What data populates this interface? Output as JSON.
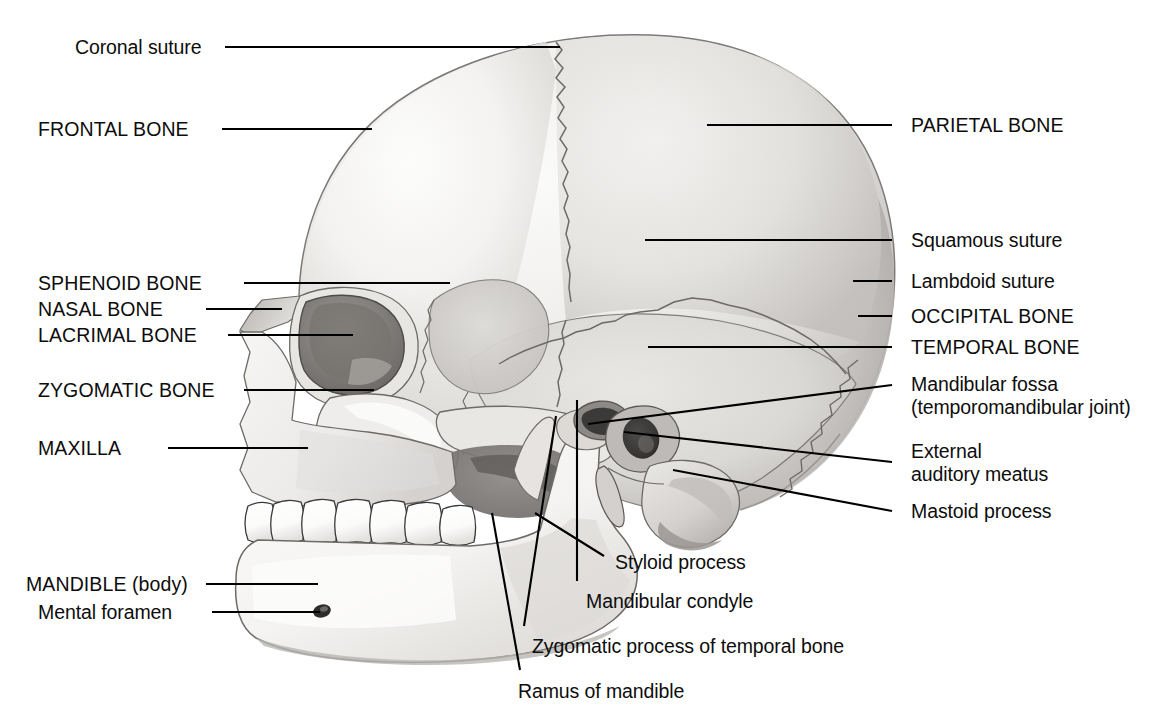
{
  "figure": {
    "type": "anatomical-illustration",
    "view": "lateral (left side)",
    "style": "grayscale pencil/airbrush rendering on white background",
    "colors": {
      "background": "#ffffff",
      "label_text": "#0d0d0d",
      "leader_line": "#000000",
      "bone_light": "#f2f1ef",
      "bone_mid": "#d9d7d4",
      "bone_shadow": "#b3b0ad",
      "bone_dark": "#8d8a87",
      "suture_line": "#6d6a67",
      "tooth_fill": "#fdfdfc",
      "tooth_outline": "#3a3a3a",
      "orbit_dark": "#7b7875"
    }
  },
  "labels": {
    "left": [
      {
        "id": "coronal-suture",
        "text": "Coronal suture",
        "caps": false,
        "x": 75,
        "y": 36,
        "line": {
          "x1": 225,
          "y1": 47,
          "x2": 560,
          "y2": 47
        }
      },
      {
        "id": "frontal-bone",
        "text": "FRONTAL BONE",
        "caps": true,
        "x": 38,
        "y": 118,
        "line": {
          "x1": 222,
          "y1": 129,
          "x2": 372,
          "y2": 129
        }
      },
      {
        "id": "sphenoid-bone",
        "text": "SPHENOID BONE",
        "caps": true,
        "x": 38,
        "y": 272,
        "line": {
          "x1": 244,
          "y1": 283,
          "x2": 450,
          "y2": 283
        }
      },
      {
        "id": "nasal-bone",
        "text": "NASAL BONE",
        "caps": true,
        "x": 38,
        "y": 298,
        "line": {
          "x1": 206,
          "y1": 309,
          "x2": 282,
          "y2": 309
        }
      },
      {
        "id": "lacrimal-bone",
        "text": "LACRIMAL BONE",
        "caps": true,
        "x": 38,
        "y": 324,
        "line": {
          "x1": 228,
          "y1": 335,
          "x2": 353,
          "y2": 335
        }
      },
      {
        "id": "zygomatic-bone",
        "text": "ZYGOMATIC BONE",
        "caps": true,
        "x": 38,
        "y": 379,
        "line": {
          "x1": 244,
          "y1": 390,
          "x2": 374,
          "y2": 390
        }
      },
      {
        "id": "maxilla",
        "text": "MAXILLA",
        "caps": true,
        "x": 38,
        "y": 437,
        "line": {
          "x1": 168,
          "y1": 448,
          "x2": 308,
          "y2": 448
        }
      },
      {
        "id": "mandible-body",
        "text": "MANDIBLE (body)",
        "caps": true,
        "x": 26,
        "y": 573,
        "line": {
          "x1": 206,
          "y1": 584,
          "x2": 318,
          "y2": 584
        }
      },
      {
        "id": "mental-foramen",
        "text": "Mental foramen",
        "caps": false,
        "x": 38,
        "y": 601,
        "line": {
          "x1": 212,
          "y1": 612,
          "x2": 320,
          "y2": 612
        }
      }
    ],
    "right": [
      {
        "id": "parietal-bone",
        "text": "PARIETAL BONE",
        "caps": true,
        "x": 911,
        "y": 114,
        "line": {
          "x1": 707,
          "y1": 125,
          "x2": 892,
          "y2": 125
        }
      },
      {
        "id": "squamous-suture",
        "text": "Squamous suture",
        "caps": false,
        "x": 911,
        "y": 229,
        "line": {
          "x1": 645,
          "y1": 240,
          "x2": 892,
          "y2": 240
        }
      },
      {
        "id": "lambdoid-suture",
        "text": "Lambdoid suture",
        "caps": false,
        "x": 911,
        "y": 270,
        "line": {
          "x1": 853,
          "y1": 281,
          "x2": 892,
          "y2": 281
        }
      },
      {
        "id": "occipital-bone",
        "text": "OCCIPITAL BONE",
        "caps": true,
        "x": 911,
        "y": 305,
        "line": {
          "x1": 858,
          "y1": 316,
          "x2": 892,
          "y2": 316
        }
      },
      {
        "id": "temporal-bone",
        "text": "TEMPORAL BONE",
        "caps": true,
        "x": 911,
        "y": 336,
        "line": {
          "x1": 648,
          "y1": 347,
          "x2": 892,
          "y2": 347
        }
      },
      {
        "id": "mandibular-fossa",
        "text": "Mandibular fossa",
        "caps": false,
        "x": 911,
        "y": 373,
        "line": {
          "x1": 588,
          "y1": 424,
          "x2": 892,
          "y2": 385
        }
      },
      {
        "id": "mandibular-fossa-2",
        "text": "(temporomandibular joint)",
        "caps": false,
        "x": 911,
        "y": 396,
        "line": null
      },
      {
        "id": "external-meatus",
        "text": "External",
        "caps": false,
        "x": 911,
        "y": 440,
        "line": {
          "x1": 624,
          "y1": 432,
          "x2": 892,
          "y2": 462
        }
      },
      {
        "id": "external-meatus-2",
        "text": "auditory meatus",
        "caps": false,
        "x": 911,
        "y": 463,
        "line": null
      },
      {
        "id": "mastoid-process",
        "text": "Mastoid process",
        "caps": false,
        "x": 911,
        "y": 500,
        "line": {
          "x1": 673,
          "y1": 470,
          "x2": 892,
          "y2": 511
        }
      }
    ],
    "bottom": [
      {
        "id": "styloid-process",
        "text": "Styloid process",
        "caps": false,
        "x": 615,
        "y": 551,
        "line": {
          "x1": 535,
          "y1": 513,
          "x2": 604,
          "y2": 556
        }
      },
      {
        "id": "mandibular-condyle",
        "text": "Mandibular condyle",
        "caps": false,
        "x": 586,
        "y": 590,
        "line": {
          "x1": 577,
          "y1": 400,
          "x2": 577,
          "y2": 581
        }
      },
      {
        "id": "zygomatic-process",
        "text": "Zygomatic process of temporal bone",
        "caps": false,
        "x": 532,
        "y": 635,
        "line": {
          "x1": 556,
          "y1": 416,
          "x2": 524,
          "y2": 626
        }
      },
      {
        "id": "ramus-of-mandible",
        "text": "Ramus of mandible",
        "caps": false,
        "x": 518,
        "y": 680,
        "line": {
          "x1": 492,
          "y1": 513,
          "x2": 520,
          "y2": 670
        }
      }
    ]
  }
}
